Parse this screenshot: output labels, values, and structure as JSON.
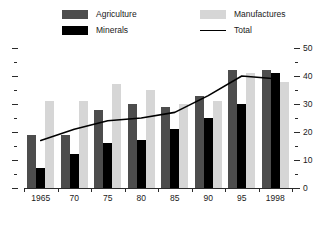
{
  "legend": {
    "items": [
      {
        "label": "Agriculture",
        "swatch": "legend-swatch-agriculture",
        "color": "#4d4d4d",
        "kind": "swatch"
      },
      {
        "label": "Minerals",
        "swatch": "legend-swatch-minerals",
        "color": "#000000",
        "kind": "swatch"
      },
      {
        "label": "Manufactures",
        "swatch": "legend-swatch-manufactures",
        "color": "#d6d6d6",
        "kind": "swatch"
      },
      {
        "label": "Total",
        "swatch": "legend-line-total",
        "color": "#000000",
        "kind": "line"
      }
    ]
  },
  "axes": {
    "right_tick_labels": [
      "50",
      "40",
      "30",
      "20",
      "10",
      "0"
    ],
    "right_tick_values": [
      50,
      40,
      30,
      20,
      10,
      0
    ],
    "minor_tick_values": [
      45,
      35,
      25,
      15,
      5
    ],
    "x_tick_labels": [
      "1965",
      "70",
      "75",
      "80",
      "85",
      "90",
      "95",
      "1998"
    ]
  },
  "chart_data": {
    "type": "bar",
    "title": "",
    "xlabel": "",
    "ylabel": "",
    "ylim": [
      0,
      50
    ],
    "grid": false,
    "legend_position": "top",
    "categories": [
      "1965",
      "70",
      "75",
      "80",
      "85",
      "90",
      "95",
      "1998"
    ],
    "series": [
      {
        "name": "Agriculture",
        "type": "bar",
        "color": "#4d4d4d",
        "values": [
          19,
          19,
          28,
          30,
          29,
          33,
          42,
          42
        ]
      },
      {
        "name": "Minerals",
        "type": "bar",
        "color": "#000000",
        "values": [
          7,
          12,
          16,
          17,
          21,
          25,
          30,
          41
        ]
      },
      {
        "name": "Manufactures",
        "type": "bar",
        "color": "#d6d6d6",
        "values": [
          31,
          31,
          37,
          35,
          30,
          31,
          41,
          38
        ]
      },
      {
        "name": "Total",
        "type": "line",
        "color": "#000000",
        "values": [
          17,
          21,
          24,
          25,
          27,
          33,
          40,
          39
        ]
      }
    ]
  }
}
